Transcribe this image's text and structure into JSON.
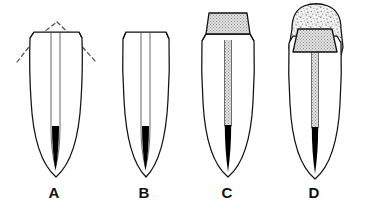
{
  "figure": {
    "background_color": "#ffffff",
    "outline_color": "#111111",
    "canal_fill_color": "#000000",
    "core_hatch_color": "#9a9a9a",
    "crown_stipple_color": "#c9c9c9",
    "dashed_guide_color": "#4a4a4a",
    "panels": [
      {
        "id": "A",
        "label": "A",
        "caption_x": 54,
        "center_x": 56,
        "crown_type": "prepared-flat-with-dashed-original-outline",
        "has_dashed_outline": true,
        "has_post": false,
        "has_crown_cap": false,
        "canal_filled": true
      },
      {
        "id": "B",
        "label": "B",
        "caption_x": 144,
        "center_x": 144,
        "crown_type": "prepared-flat",
        "has_dashed_outline": false,
        "has_post": false,
        "has_crown_cap": false,
        "canal_filled": true
      },
      {
        "id": "C",
        "label": "C",
        "caption_x": 227,
        "center_x": 228,
        "crown_type": "post-and-core",
        "has_dashed_outline": false,
        "has_post": true,
        "has_crown_cap": false,
        "canal_filled": true
      },
      {
        "id": "D",
        "label": "D",
        "caption_x": 314,
        "center_x": 315,
        "crown_type": "post-and-core-with-cemented-crown",
        "has_dashed_outline": false,
        "has_post": true,
        "has_crown_cap": true,
        "canal_filled": true
      }
    ]
  }
}
